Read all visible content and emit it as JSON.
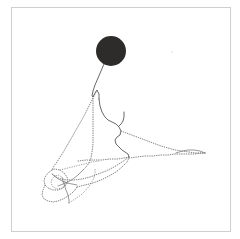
{
  "figure": {
    "background_color": "#ffffff",
    "frame": {
      "label": "figure-border",
      "color": "#cfcfcf",
      "x": 11,
      "y": 7,
      "width": 220,
      "height": 225
    },
    "marker": {
      "label": "filled-circle-marker",
      "shape": "circle",
      "center_x": 111,
      "center_y": 51,
      "radius": 15,
      "fill_color": "#2e2b2b"
    },
    "speck": {
      "label": "stray-speck",
      "center_x": 172,
      "center_y": 52,
      "radius": 1.2,
      "fill_color": "#f0eeee"
    },
    "stroke_colors": {
      "dotted": "#6f6c6c",
      "dotted_faint": "#8f8c8c",
      "solid": "#5a5757",
      "solid_thin": "#7a7777"
    }
  },
  "chart_data": {
    "type": "line",
    "subtitle": "",
    "xlabel": "",
    "ylabel": "",
    "xlim": [
      11,
      231
    ],
    "ylim": [
      7,
      232
    ],
    "grid": false,
    "legend_position": "none",
    "tick_labels_x": [],
    "tick_labels_y": [],
    "annotations": [],
    "marker_points": [
      {
        "name": "filled-circle-marker",
        "x": 111,
        "y": 51,
        "size": 30,
        "color": "#2e2b2b"
      }
    ],
    "series": [
      {
        "name": "tether-from-marker",
        "style": "solid",
        "color": "#5a5757",
        "points": [
          [
            104,
            64
          ],
          [
            101,
            71
          ],
          [
            98,
            78
          ],
          [
            95,
            85
          ],
          [
            93,
            91
          ],
          [
            92,
            96
          ],
          [
            93,
            97
          ],
          [
            95,
            93
          ],
          [
            97,
            90
          ],
          [
            99,
            94
          ],
          [
            99,
            99
          ]
        ]
      },
      {
        "name": "upper-solid-ridge",
        "style": "solid",
        "color": "#5a5757",
        "points": [
          [
            99,
            99
          ],
          [
            100,
            106
          ],
          [
            102,
            112
          ],
          [
            105,
            117
          ],
          [
            108,
            120
          ],
          [
            112,
            122
          ],
          [
            116,
            124
          ],
          [
            119,
            127
          ],
          [
            121,
            131
          ],
          [
            120,
            135
          ],
          [
            117,
            137
          ],
          [
            115,
            140
          ],
          [
            116,
            144
          ],
          [
            119,
            147
          ],
          [
            122,
            150
          ],
          [
            125,
            152
          ],
          [
            128,
            154
          ],
          [
            129,
            157
          ]
        ]
      },
      {
        "name": "branch-stub-vertical",
        "style": "solid",
        "color": "#5a5757",
        "points": [
          [
            124,
            112
          ],
          [
            124,
            117
          ],
          [
            123,
            121
          ],
          [
            121,
            124
          ],
          [
            119,
            126
          ]
        ]
      },
      {
        "name": "left-long-diagonal-dotted",
        "style": "dotted",
        "color": "#6f6c6c",
        "points": [
          [
            96,
            92
          ],
          [
            92,
            100
          ],
          [
            88,
            108
          ],
          [
            84,
            116
          ],
          [
            80,
            123
          ],
          [
            76,
            130
          ],
          [
            72,
            137
          ],
          [
            68,
            144
          ],
          [
            64,
            151
          ],
          [
            60,
            157
          ],
          [
            57,
            162
          ],
          [
            54,
            166
          ],
          [
            52,
            170
          ]
        ]
      },
      {
        "name": "center-vertical-dotted",
        "style": "dotted",
        "color": "#6f6c6c",
        "points": [
          [
            93,
            96
          ],
          [
            93,
            104
          ],
          [
            93,
            112
          ],
          [
            93,
            120
          ],
          [
            93,
            128
          ],
          [
            93,
            136
          ],
          [
            93,
            144
          ],
          [
            92,
            152
          ],
          [
            91,
            158
          ],
          [
            89,
            163
          ],
          [
            86,
            167
          ],
          [
            83,
            170
          ]
        ]
      },
      {
        "name": "mid-horizontal-dotted",
        "style": "dotted",
        "color": "#6f6c6c",
        "points": [
          [
            78,
            161
          ],
          [
            86,
            160
          ],
          [
            94,
            160
          ],
          [
            102,
            160
          ],
          [
            110,
            159
          ],
          [
            118,
            159
          ],
          [
            124,
            158
          ],
          [
            129,
            157
          ]
        ]
      },
      {
        "name": "right-tail-upper-dotted",
        "style": "dotted",
        "color": "#6f6c6c",
        "points": [
          [
            121,
            131
          ],
          [
            129,
            134
          ],
          [
            137,
            137
          ],
          [
            145,
            140
          ],
          [
            153,
            143
          ],
          [
            161,
            146
          ],
          [
            168,
            148
          ],
          [
            175,
            150
          ],
          [
            182,
            151
          ],
          [
            189,
            152
          ],
          [
            195,
            153
          ],
          [
            201,
            153
          ],
          [
            205,
            153
          ]
        ]
      },
      {
        "name": "right-tail-lower-dotted",
        "style": "dotted",
        "color": "#6f6c6c",
        "points": [
          [
            129,
            158
          ],
          [
            137,
            157
          ],
          [
            145,
            156
          ],
          [
            153,
            156
          ],
          [
            161,
            155
          ],
          [
            168,
            155
          ],
          [
            175,
            154
          ],
          [
            182,
            154
          ],
          [
            189,
            154
          ],
          [
            195,
            154
          ],
          [
            201,
            153
          ],
          [
            205,
            153
          ]
        ]
      },
      {
        "name": "tail-tip-hook",
        "style": "solid-thin",
        "color": "#7a7777",
        "points": [
          [
            205,
            153
          ],
          [
            200,
            151
          ],
          [
            194,
            150
          ],
          [
            188,
            150
          ],
          [
            183,
            151
          ],
          [
            179,
            152
          ],
          [
            176,
            153
          ]
        ]
      },
      {
        "name": "lower-fan-dotted",
        "style": "dotted",
        "color": "#6f6c6c",
        "points": [
          [
            129,
            157
          ],
          [
            122,
            162
          ],
          [
            114,
            167
          ],
          [
            106,
            171
          ],
          [
            98,
            174
          ],
          [
            90,
            177
          ],
          [
            82,
            179
          ],
          [
            74,
            180
          ],
          [
            67,
            180
          ],
          [
            61,
            179
          ],
          [
            56,
            177
          ],
          [
            52,
            174
          ]
        ]
      },
      {
        "name": "knot-outer-loop",
        "style": "dotted",
        "color": "#6f6c6c",
        "points": [
          [
            52,
            170
          ],
          [
            48,
            173
          ],
          [
            45,
            177
          ],
          [
            44,
            181
          ],
          [
            45,
            185
          ],
          [
            48,
            188
          ],
          [
            53,
            190
          ],
          [
            58,
            190
          ],
          [
            63,
            188
          ],
          [
            66,
            185
          ],
          [
            68,
            181
          ],
          [
            67,
            177
          ],
          [
            64,
            173
          ],
          [
            60,
            170
          ],
          [
            55,
            169
          ],
          [
            52,
            170
          ]
        ]
      },
      {
        "name": "knot-inner-loop",
        "style": "dotted-faint",
        "color": "#8f8c8c",
        "points": [
          [
            55,
            176
          ],
          [
            52,
            179
          ],
          [
            51,
            183
          ],
          [
            53,
            187
          ],
          [
            57,
            189
          ],
          [
            62,
            188
          ],
          [
            65,
            185
          ],
          [
            65,
            181
          ],
          [
            62,
            177
          ],
          [
            58,
            175
          ],
          [
            55,
            176
          ]
        ]
      },
      {
        "name": "knot-lower-flare",
        "style": "dotted",
        "color": "#6f6c6c",
        "points": [
          [
            45,
            185
          ],
          [
            43,
            190
          ],
          [
            42,
            195
          ],
          [
            44,
            199
          ],
          [
            48,
            201
          ],
          [
            53,
            202
          ],
          [
            58,
            201
          ],
          [
            63,
            199
          ],
          [
            68,
            196
          ],
          [
            72,
            193
          ],
          [
            75,
            190
          ],
          [
            77,
            187
          ]
        ]
      },
      {
        "name": "knot-spine-down",
        "style": "solid-thin",
        "color": "#7a7777",
        "points": [
          [
            62,
            178
          ],
          [
            64,
            184
          ],
          [
            66,
            190
          ],
          [
            68,
            195
          ],
          [
            69,
            200
          ],
          [
            69,
            203
          ]
        ]
      },
      {
        "name": "knot-radial-a",
        "style": "solid-thin",
        "color": "#7a7777",
        "points": [
          [
            52,
            174
          ],
          [
            57,
            178
          ],
          [
            62,
            181
          ],
          [
            67,
            183
          ],
          [
            72,
            184
          ],
          [
            77,
            185
          ]
        ]
      },
      {
        "name": "knot-radial-b",
        "style": "solid-thin",
        "color": "#7a7777",
        "points": [
          [
            83,
            170
          ],
          [
            78,
            175
          ],
          [
            73,
            179
          ],
          [
            68,
            182
          ],
          [
            63,
            184
          ],
          [
            58,
            186
          ]
        ]
      },
      {
        "name": "knot-to-fan-link",
        "style": "dotted-faint",
        "color": "#8f8c8c",
        "points": [
          [
            69,
            203
          ],
          [
            75,
            199
          ],
          [
            81,
            195
          ],
          [
            86,
            190
          ],
          [
            90,
            185
          ],
          [
            93,
            180
          ],
          [
            95,
            174
          ],
          [
            95,
            168
          ]
        ]
      },
      {
        "name": "lower-right-dotted-return",
        "style": "dotted",
        "color": "#6f6c6c",
        "points": [
          [
            77,
            187
          ],
          [
            85,
            185
          ],
          [
            93,
            183
          ],
          [
            101,
            180
          ],
          [
            109,
            176
          ],
          [
            116,
            172
          ],
          [
            122,
            167
          ],
          [
            127,
            162
          ],
          [
            129,
            158
          ]
        ]
      },
      {
        "name": "inner-cross-dotted",
        "style": "dotted-faint",
        "color": "#8f8c8c",
        "points": [
          [
            60,
            170
          ],
          [
            68,
            168
          ],
          [
            76,
            166
          ],
          [
            84,
            164
          ],
          [
            92,
            162
          ],
          [
            99,
            161
          ]
        ]
      }
    ]
  }
}
